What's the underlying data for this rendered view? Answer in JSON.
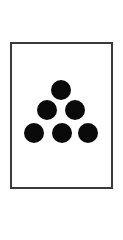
{
  "card": {
    "label": "Card with six dots",
    "dot_count": 6,
    "dot_color": "#0a0a0a",
    "border_color": "#3a3a3a",
    "dots": [
      {
        "row": 1,
        "cx": 61,
        "cy": 90
      },
      {
        "row": 2,
        "cx": 47,
        "cy": 110
      },
      {
        "row": 2,
        "cx": 75,
        "cy": 110
      },
      {
        "row": 3,
        "cx": 34,
        "cy": 133
      },
      {
        "row": 3,
        "cx": 62,
        "cy": 133
      },
      {
        "row": 3,
        "cx": 88,
        "cy": 133
      }
    ]
  }
}
